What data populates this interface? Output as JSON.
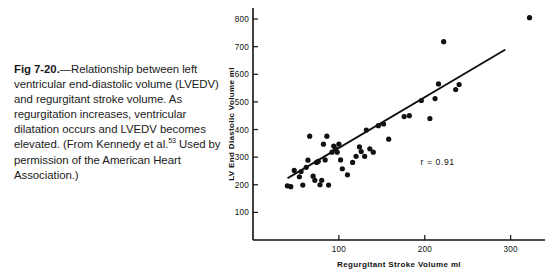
{
  "caption": {
    "fig_label": "Fig 7-20.",
    "dash": "—",
    "text_before_ref": "Relationship between left ventricular end-diastolic volume (LVEDV) and regurgitant stroke volume. As regurgitation increases, ventricular dilatation occurs and LVEDV becomes elevated. (From Kennedy et al.",
    "reference_superscript": "53",
    "text_after_ref": " Used by permission of the American Heart Association.)"
  },
  "chart_data": {
    "type": "scatter",
    "title": "",
    "xlabel": "Regurgitant Stroke Volume ml",
    "ylabel": "LV End Diastolic Volume ml",
    "xlim": [
      0,
      340
    ],
    "ylim": [
      0,
      840
    ],
    "xticks": [
      100,
      200,
      300
    ],
    "yticks": [
      100,
      200,
      300,
      400,
      500,
      600,
      700,
      800
    ],
    "grid": false,
    "legend": null,
    "annotations": [
      {
        "text": "r = 0.91",
        "x": 215,
        "y": 270
      }
    ],
    "series": [
      {
        "name": "Patients",
        "marker": "filled-circle",
        "color": "#111111",
        "points": [
          [
            40,
            196
          ],
          [
            44,
            193
          ],
          [
            48,
            252
          ],
          [
            54,
            229
          ],
          [
            56,
            248
          ],
          [
            58,
            199
          ],
          [
            62,
            263
          ],
          [
            64,
            289
          ],
          [
            66,
            376
          ],
          [
            70,
            231
          ],
          [
            72,
            216
          ],
          [
            74,
            281
          ],
          [
            76,
            285
          ],
          [
            78,
            200
          ],
          [
            80,
            216
          ],
          [
            82,
            347
          ],
          [
            84,
            290
          ],
          [
            86,
            376
          ],
          [
            88,
            199
          ],
          [
            92,
            318
          ],
          [
            94,
            340
          ],
          [
            96,
            330
          ],
          [
            98,
            318
          ],
          [
            100,
            347
          ],
          [
            102,
            290
          ],
          [
            104,
            258
          ],
          [
            110,
            236
          ],
          [
            116,
            281
          ],
          [
            120,
            303
          ],
          [
            124,
            337
          ],
          [
            126,
            320
          ],
          [
            130,
            303
          ],
          [
            132,
            398
          ],
          [
            136,
            330
          ],
          [
            140,
            318
          ],
          [
            146,
            414
          ],
          [
            152,
            420
          ],
          [
            158,
            365
          ],
          [
            176,
            447
          ],
          [
            182,
            450
          ],
          [
            196,
            505
          ],
          [
            206,
            440
          ],
          [
            212,
            512
          ],
          [
            216,
            565
          ],
          [
            222,
            718
          ],
          [
            236,
            545
          ],
          [
            240,
            563
          ],
          [
            322,
            805
          ]
        ]
      }
    ],
    "regression_line": {
      "name": "regression",
      "color": "#111111",
      "x_start": 41,
      "y_start": 225,
      "x_end": 293,
      "y_end": 688
    }
  }
}
